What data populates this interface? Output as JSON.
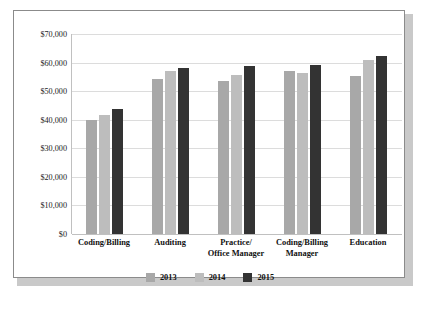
{
  "chart_data": {
    "type": "bar",
    "title": "",
    "subtitle": "",
    "xlabel": "",
    "ylabel": "",
    "ylim": [
      0,
      70000
    ],
    "ytick_step": 10000,
    "ytick_labels": [
      "$70,000",
      "$60,000",
      "$50,000",
      "$40,000",
      "$30,000",
      "$20,000",
      "$10,000",
      "$0"
    ],
    "ytick_values": [
      70000,
      60000,
      50000,
      40000,
      30000,
      20000,
      10000,
      0
    ],
    "grid": true,
    "legend_position": "bottom",
    "categories": [
      "Coding/Billing",
      "Auditing",
      "Practice/ Office Manager",
      "Coding/Billing Manager",
      "Education"
    ],
    "category_lines": [
      [
        "Coding/Billing",
        ""
      ],
      [
        "Auditing",
        ""
      ],
      [
        "Practice/",
        "Office Manager"
      ],
      [
        "Coding/Billing",
        "Manager"
      ],
      [
        "Education",
        ""
      ]
    ],
    "series": [
      {
        "name": "2013",
        "color": "#a8a8a8",
        "values": [
          40000,
          54400,
          53400,
          57000,
          55400
        ]
      },
      {
        "name": "2014",
        "color": "#bdbdbd",
        "values": [
          41500,
          57000,
          55500,
          56300,
          61000
        ]
      },
      {
        "name": "2015",
        "color": "#333333",
        "values": [
          43700,
          58000,
          58800,
          59300,
          62200
        ]
      }
    ]
  },
  "legend": {
    "entries": [
      {
        "label": "2013",
        "color": "#a8a8a8"
      },
      {
        "label": "2014",
        "color": "#bdbdbd"
      },
      {
        "label": "2015",
        "color": "#333333"
      }
    ]
  },
  "colors": {
    "series_2013": "#a8a8a8",
    "series_2014": "#bdbdbd",
    "series_2015": "#333333",
    "gridline": "#dcdcdc",
    "axis": "#c0c0c0",
    "frame_border": "#8b8b8b",
    "shadow": "#c9c9c9",
    "background": "#ffffff",
    "text": "#111111"
  }
}
